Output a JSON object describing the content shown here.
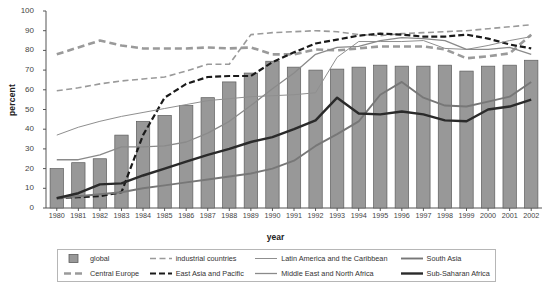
{
  "chart_data": {
    "type": "bar",
    "title": "",
    "xlabel": "year",
    "ylabel": "percent",
    "ylim": [
      0,
      100
    ],
    "ytick_step": 10,
    "yticks": [
      0,
      10,
      20,
      30,
      40,
      50,
      60,
      70,
      80,
      90,
      100
    ],
    "grid": false,
    "legend_position": "bottom",
    "categories": [
      "1980",
      "1981",
      "1982",
      "1983",
      "1984",
      "1985",
      "1986",
      "1987",
      "1988",
      "1989",
      "1990",
      "1991",
      "1992",
      "1993",
      "1994",
      "1995",
      "1996",
      "1997",
      "1998",
      "1999",
      "2000",
      "2001",
      "2002"
    ],
    "bars": {
      "name": "global",
      "values": [
        20,
        23,
        25,
        37,
        44,
        47,
        52,
        56,
        64,
        68.5,
        74.5,
        71.5,
        70,
        70.5,
        71.5,
        72.5,
        72,
        72,
        72.5,
        69.5,
        72,
        72.5,
        75
      ]
    },
    "series": [
      {
        "name": "industrial countries",
        "style": "dashed-light",
        "color": "#9a9a9a",
        "values": [
          59.5,
          61,
          63,
          64.5,
          65.5,
          66.5,
          69.5,
          73,
          73,
          88,
          89,
          89.5,
          90,
          89.5,
          88,
          87.5,
          88.5,
          89,
          89.5,
          90,
          91,
          92,
          93
        ]
      },
      {
        "name": "Central Europe",
        "style": "dashed-heavy",
        "color": "#9a9a9a",
        "values": [
          78,
          81.5,
          85,
          82.5,
          81,
          81,
          81,
          81.5,
          81,
          81.5,
          78,
          78,
          80.5,
          80,
          81,
          82,
          82,
          82,
          80.5,
          76,
          77,
          78.5,
          88
        ]
      },
      {
        "name": "East Asia and Pacific",
        "style": "dashed-dark",
        "color": "#1a1a1a",
        "values": [
          5,
          5.5,
          6,
          8,
          37,
          56,
          63,
          66.5,
          67,
          67,
          74,
          79,
          83.5,
          85.5,
          87.5,
          88.5,
          88,
          87,
          87,
          88,
          86,
          83,
          81
        ]
      },
      {
        "name": "Latin America and the Caribbean",
        "style": "thin-light",
        "color": "#8f8f8f",
        "values": [
          37,
          41,
          44,
          46.5,
          48.5,
          50.5,
          52.5,
          54.5,
          55.5,
          56.5,
          57,
          57.5,
          58.5,
          76.5,
          84.5,
          84.5,
          84.5,
          85,
          81,
          80.5,
          82.5,
          85,
          87
        ]
      },
      {
        "name": "Middle East and North Africa",
        "style": "thin-medium",
        "color": "#8a8a8a",
        "values": [
          24.5,
          24.5,
          27,
          31,
          31,
          31.5,
          33.5,
          38,
          44,
          52,
          60.5,
          68.5,
          78,
          81.5,
          82,
          85,
          86.5,
          86,
          85,
          80.5,
          80.5,
          81.5,
          78
        ]
      },
      {
        "name": "South Asia",
        "style": "thick-medium",
        "color": "#777777",
        "values": [
          5,
          6,
          7,
          8,
          10,
          11.5,
          13,
          14.5,
          16,
          17.5,
          20,
          24,
          31.5,
          37.5,
          44,
          57.5,
          64,
          56,
          52,
          51.5,
          54,
          56.5,
          64
        ]
      },
      {
        "name": "Sub-Saharan Africa",
        "style": "thick-dark",
        "color": "#2a2a2a",
        "values": [
          5,
          7.5,
          12,
          12.5,
          16.5,
          20,
          23.5,
          27,
          30,
          33.5,
          36,
          40,
          44.5,
          56,
          48,
          47.5,
          49,
          47.5,
          44.5,
          44,
          50,
          51.5,
          55
        ]
      }
    ],
    "legend": [
      {
        "label": "global",
        "style": "bar-swatch"
      },
      {
        "label": "industrial countries",
        "style": "dashed-light"
      },
      {
        "label": "Latin America and the Caribbean",
        "style": "thin-light"
      },
      {
        "label": "South Asia",
        "style": "thick-medium"
      },
      {
        "label": "Central Europe",
        "style": "dashed-heavy"
      },
      {
        "label": "East Asia and Pacific",
        "style": "dashed-dark"
      },
      {
        "label": "Middle East and North Africa",
        "style": "thin-medium"
      },
      {
        "label": "Sub-Saharan Africa",
        "style": "thick-dark"
      }
    ],
    "colors": {
      "bar_fill": "#989898",
      "bar_stroke": "#5d5d5d",
      "axis": "#555555",
      "background": "#ffffff"
    }
  }
}
